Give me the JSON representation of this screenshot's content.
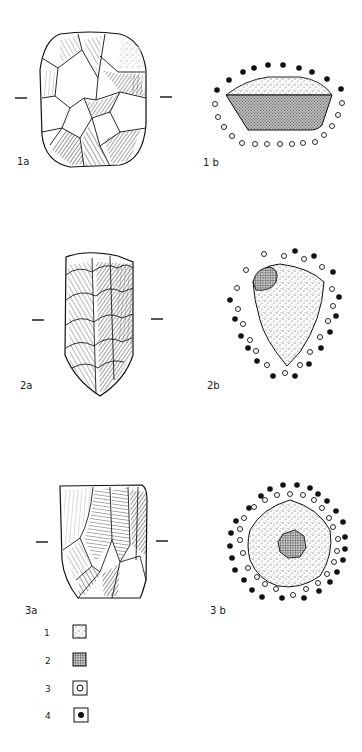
{
  "figures": [
    {
      "id": "1a",
      "label": "1a",
      "type": "lithic-core-side-view"
    },
    {
      "id": "1b",
      "label": "1b",
      "type": "platform-view",
      "filled_dots": [
        [
          217,
          90
        ],
        [
          229,
          80
        ],
        [
          243,
          72
        ],
        [
          254,
          68
        ],
        [
          268,
          65
        ],
        [
          283,
          65
        ],
        [
          299,
          68
        ],
        [
          312,
          72
        ],
        [
          327,
          79
        ],
        [
          341,
          89
        ]
      ],
      "open_dots": [
        [
          215,
          104
        ],
        [
          218,
          117
        ],
        [
          224,
          127
        ],
        [
          232,
          136
        ],
        [
          242,
          143
        ],
        [
          255,
          144
        ],
        [
          267,
          144
        ],
        [
          280,
          144
        ],
        [
          292,
          144
        ],
        [
          303,
          143
        ],
        [
          315,
          142
        ],
        [
          324,
          135
        ],
        [
          332,
          126
        ],
        [
          338,
          115
        ],
        [
          342,
          103
        ]
      ]
    },
    {
      "id": "2a",
      "label": "2a",
      "type": "lithic-core-side-view"
    },
    {
      "id": "2b",
      "label": "2b",
      "type": "platform-view",
      "filled_dots": [
        [
          295,
          251
        ],
        [
          314,
          256
        ],
        [
          333,
          272
        ],
        [
          339,
          297
        ],
        [
          336,
          316
        ],
        [
          230,
          300
        ],
        [
          235,
          319
        ],
        [
          241,
          336
        ],
        [
          248,
          348
        ],
        [
          257,
          361
        ],
        [
          273,
          376
        ],
        [
          295,
          376
        ],
        [
          309,
          364
        ],
        [
          321,
          348
        ],
        [
          330,
          332
        ]
      ],
      "open_dots": [
        [
          264,
          254
        ],
        [
          284,
          256
        ],
        [
          304,
          259
        ],
        [
          322,
          267
        ],
        [
          246,
          270
        ],
        [
          237,
          288
        ],
        [
          332,
          289
        ],
        [
          333,
          306
        ],
        [
          238,
          309
        ],
        [
          243,
          324
        ],
        [
          328,
          321
        ],
        [
          320,
          337
        ],
        [
          250,
          340
        ],
        [
          256,
          351
        ],
        [
          310,
          352
        ],
        [
          267,
          365
        ],
        [
          300,
          365
        ],
        [
          285,
          373
        ]
      ]
    },
    {
      "id": "3a",
      "label": "3a",
      "type": "lithic-core-side-view"
    },
    {
      "id": "3b",
      "label": "3b",
      "type": "platform-view",
      "filled_dots": [
        [
          270,
          489
        ],
        [
          283,
          485
        ],
        [
          297,
          485
        ],
        [
          310,
          488
        ],
        [
          318,
          494
        ],
        [
          327,
          501
        ],
        [
          336,
          511
        ],
        [
          343,
          522
        ],
        [
          345,
          537
        ],
        [
          345,
          549
        ],
        [
          343,
          560
        ],
        [
          337,
          572
        ],
        [
          330,
          582
        ],
        [
          319,
          591
        ],
        [
          304,
          598
        ],
        [
          282,
          598
        ],
        [
          262,
          597
        ],
        [
          252,
          590
        ],
        [
          244,
          580
        ],
        [
          235,
          570
        ],
        [
          232,
          558
        ],
        [
          230,
          546
        ],
        [
          231,
          533
        ],
        [
          236,
          521
        ],
        [
          249,
          508
        ],
        [
          261,
          496
        ]
      ],
      "open_dots": [
        [
          277,
          495
        ],
        [
          290,
          494
        ],
        [
          303,
          495
        ],
        [
          314,
          500
        ],
        [
          322,
          508
        ],
        [
          329,
          518
        ],
        [
          333,
          527
        ],
        [
          338,
          539
        ],
        [
          337,
          551
        ],
        [
          334,
          562
        ],
        [
          327,
          574
        ],
        [
          318,
          583
        ],
        [
          306,
          589
        ],
        [
          293,
          595
        ],
        [
          276,
          589
        ],
        [
          265,
          584
        ],
        [
          257,
          577
        ],
        [
          248,
          568
        ],
        [
          243,
          553
        ],
        [
          240,
          540
        ],
        [
          240,
          529
        ],
        [
          244,
          518
        ],
        [
          254,
          507
        ],
        [
          265,
          500
        ]
      ]
    }
  ],
  "legend": [
    {
      "num": "1",
      "symbol": "stippled-cortex"
    },
    {
      "num": "2",
      "symbol": "hatched-surface"
    },
    {
      "num": "3",
      "symbol": "open-circle"
    },
    {
      "num": "4",
      "symbol": "filled-circle"
    }
  ]
}
